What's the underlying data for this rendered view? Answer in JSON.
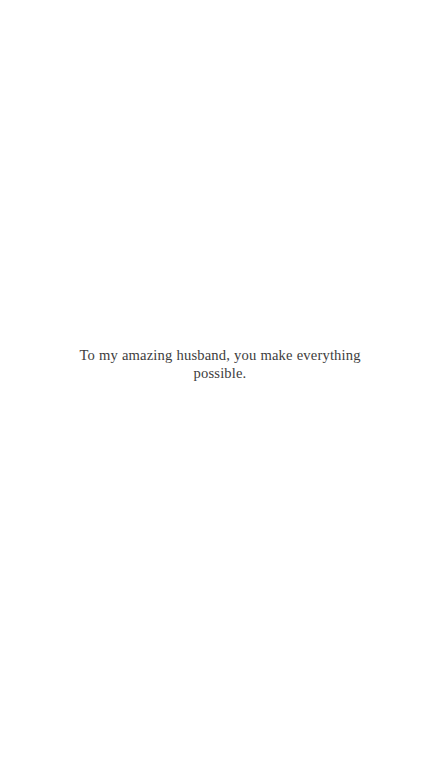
{
  "page": {
    "background_color": "#ffffff",
    "width": 440,
    "height": 766
  },
  "message": {
    "text": "To my amazing husband, you make everything possible.",
    "color": "#3d3d3d",
    "alignment": "center"
  }
}
